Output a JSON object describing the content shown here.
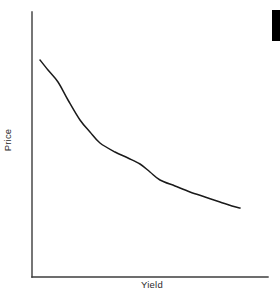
{
  "figure": {
    "background_color": "#ffffff",
    "width": 280,
    "height": 297
  },
  "axes": {
    "line_color": "#3c3c3c",
    "x_axis": {
      "x_start": 32,
      "x_end": 268,
      "y": 277
    },
    "y_axis": {
      "x": 32,
      "y_start": 12,
      "y_end": 277
    }
  },
  "edge_marker": {
    "name": "cropped-black-bar",
    "color": "#000000"
  },
  "chart_data": {
    "type": "line",
    "title": "",
    "xlabel": "Yield",
    "ylabel": "Price",
    "grid": false,
    "legend": null,
    "axis_ticks": {
      "x": [],
      "y": []
    },
    "xlim": [
      0,
      1
    ],
    "ylim": [
      0,
      1
    ],
    "series": [
      {
        "name": "price-yield-curve",
        "color": "#1a1a1a",
        "description": "convex decreasing curve: price falls as yield rises",
        "points_px": [
          [
            40,
            60
          ],
          [
            48,
            70
          ],
          [
            58,
            82
          ],
          [
            68,
            100
          ],
          [
            80,
            120
          ],
          [
            90,
            132
          ],
          [
            100,
            143
          ],
          [
            115,
            152
          ],
          [
            128,
            158
          ],
          [
            140,
            164
          ],
          [
            150,
            172
          ],
          [
            160,
            180
          ],
          [
            175,
            186
          ],
          [
            190,
            192
          ],
          [
            205,
            197
          ],
          [
            220,
            202
          ],
          [
            232,
            206
          ],
          [
            240,
            208
          ]
        ],
        "x": [
          0.03,
          0.07,
          0.11,
          0.15,
          0.2,
          0.25,
          0.29,
          0.35,
          0.41,
          0.46,
          0.5,
          0.54,
          0.61,
          0.67,
          0.73,
          0.8,
          0.85,
          0.88
        ],
        "y": [
          0.82,
          0.78,
          0.74,
          0.67,
          0.59,
          0.55,
          0.51,
          0.47,
          0.45,
          0.43,
          0.4,
          0.37,
          0.34,
          0.32,
          0.3,
          0.28,
          0.27,
          0.26
        ]
      }
    ]
  }
}
